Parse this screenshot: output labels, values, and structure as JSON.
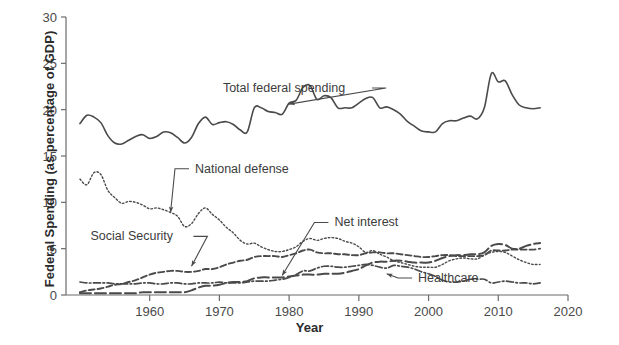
{
  "chart_data": {
    "type": "line",
    "title": "",
    "xlabel": "Year",
    "ylabel": "Federal Spending (as percentage of GDP)",
    "xlim": [
      1948,
      2020
    ],
    "ylim": [
      0,
      30
    ],
    "xticks": [
      1960,
      1970,
      1980,
      1990,
      2000,
      2010,
      2020
    ],
    "xtick_labels": [
      "1960",
      "1970",
      "1980",
      "1990",
      "2000",
      "2010",
      "2020"
    ],
    "yticks": [
      0,
      5,
      10,
      15,
      20,
      25,
      30
    ],
    "ytick_labels": [
      "0",
      "5",
      "10",
      "15",
      "20",
      "25",
      "30"
    ],
    "grid": false,
    "legend_position": "inline-annotations",
    "line_color": "#4a4a4a",
    "series": [
      {
        "name": "Total federal spending",
        "style": "solid",
        "x": [
          1950,
          1951,
          1952,
          1953,
          1954,
          1955,
          1956,
          1957,
          1958,
          1959,
          1960,
          1961,
          1962,
          1963,
          1964,
          1965,
          1966,
          1967,
          1968,
          1969,
          1970,
          1971,
          1972,
          1973,
          1974,
          1975,
          1976,
          1977,
          1978,
          1979,
          1980,
          1981,
          1982,
          1983,
          1984,
          1985,
          1986,
          1987,
          1988,
          1989,
          1990,
          1991,
          1992,
          1993,
          1994,
          1995,
          1996,
          1997,
          1998,
          1999,
          2000,
          2001,
          2002,
          2003,
          2004,
          2005,
          2006,
          2007,
          2008,
          2009,
          2010,
          2011,
          2012,
          2013,
          2014,
          2015,
          2016
        ],
        "values": [
          18.5,
          19.4,
          19.2,
          18.6,
          17.2,
          16.4,
          16.3,
          16.7,
          17.1,
          17.3,
          16.9,
          17.1,
          17.6,
          17.5,
          17.0,
          16.4,
          17.0,
          18.5,
          19.2,
          18.4,
          18.6,
          18.7,
          18.4,
          17.8,
          17.6,
          20.2,
          20.2,
          19.8,
          19.7,
          19.5,
          20.7,
          21.0,
          22.4,
          22.6,
          21.1,
          21.5,
          21.3,
          20.2,
          20.2,
          20.2,
          20.7,
          21.2,
          21.3,
          20.2,
          20.3,
          20.0,
          19.5,
          18.7,
          18.2,
          17.7,
          17.6,
          17.6,
          18.5,
          18.8,
          18.8,
          19.1,
          19.3,
          19.0,
          20.2,
          23.9,
          23.0,
          23.1,
          21.6,
          20.5,
          20.2,
          20.1,
          20.2
        ]
      },
      {
        "name": "National defense",
        "style": "dotted",
        "x": [
          1950,
          1951,
          1952,
          1953,
          1954,
          1955,
          1956,
          1957,
          1958,
          1959,
          1960,
          1961,
          1962,
          1963,
          1964,
          1965,
          1966,
          1967,
          1968,
          1969,
          1970,
          1971,
          1972,
          1973,
          1974,
          1975,
          1976,
          1977,
          1978,
          1979,
          1980,
          1981,
          1982,
          1983,
          1984,
          1985,
          1986,
          1987,
          1988,
          1989,
          1990,
          1991,
          1992,
          1993,
          1994,
          1995,
          1996,
          1997,
          1998,
          1999,
          2000,
          2001,
          2002,
          2003,
          2004,
          2005,
          2006,
          2007,
          2008,
          2009,
          2010,
          2011,
          2012,
          2013,
          2014,
          2015,
          2016
        ],
        "values": [
          12.5,
          11.9,
          13.2,
          13.0,
          11.3,
          10.5,
          9.9,
          10.1,
          10.0,
          9.7,
          9.3,
          9.4,
          9.2,
          8.9,
          8.5,
          7.4,
          7.7,
          8.8,
          9.4,
          8.7,
          8.1,
          7.3,
          6.7,
          5.9,
          5.5,
          5.6,
          5.2,
          4.9,
          4.7,
          4.7,
          4.9,
          5.2,
          5.8,
          6.1,
          5.9,
          6.1,
          6.2,
          6.1,
          5.8,
          5.6,
          5.2,
          4.6,
          4.8,
          4.4,
          4.1,
          3.7,
          3.5,
          3.3,
          3.1,
          3.0,
          3.0,
          3.0,
          3.3,
          3.7,
          3.9,
          4.0,
          3.9,
          3.9,
          4.3,
          4.6,
          4.7,
          4.6,
          4.2,
          3.8,
          3.5,
          3.3,
          3.3
        ]
      },
      {
        "name": "Social Security",
        "style": "dashed",
        "x": [
          1950,
          1951,
          1952,
          1953,
          1954,
          1955,
          1956,
          1957,
          1958,
          1959,
          1960,
          1961,
          1962,
          1963,
          1964,
          1965,
          1966,
          1967,
          1968,
          1969,
          1970,
          1971,
          1972,
          1973,
          1974,
          1975,
          1976,
          1977,
          1978,
          1979,
          1980,
          1981,
          1982,
          1983,
          1984,
          1985,
          1986,
          1987,
          1988,
          1989,
          1990,
          1991,
          1992,
          1993,
          1994,
          1995,
          1996,
          1997,
          1998,
          1999,
          2000,
          2001,
          2002,
          2003,
          2004,
          2005,
          2006,
          2007,
          2008,
          2009,
          2010,
          2011,
          2012,
          2013,
          2014,
          2015,
          2016
        ],
        "values": [
          0.3,
          0.5,
          0.6,
          0.7,
          0.9,
          1.1,
          1.2,
          1.4,
          1.6,
          1.9,
          2.2,
          2.4,
          2.5,
          2.6,
          2.6,
          2.5,
          2.5,
          2.6,
          2.8,
          2.8,
          3.0,
          3.3,
          3.5,
          3.7,
          3.8,
          4.1,
          4.2,
          4.2,
          4.2,
          4.1,
          4.3,
          4.5,
          4.8,
          4.9,
          4.6,
          4.5,
          4.5,
          4.4,
          4.4,
          4.3,
          4.3,
          4.5,
          4.6,
          4.6,
          4.5,
          4.5,
          4.4,
          4.3,
          4.2,
          4.1,
          4.1,
          4.2,
          4.3,
          4.3,
          4.2,
          4.2,
          4.2,
          4.2,
          4.3,
          4.8,
          4.8,
          4.8,
          4.9,
          4.9,
          4.9,
          4.9,
          5.0
        ]
      },
      {
        "name": "Net interest",
        "style": "dash-dot",
        "x": [
          1950,
          1951,
          1952,
          1953,
          1954,
          1955,
          1956,
          1957,
          1958,
          1959,
          1960,
          1961,
          1962,
          1963,
          1964,
          1965,
          1966,
          1967,
          1968,
          1969,
          1970,
          1971,
          1972,
          1973,
          1974,
          1975,
          1976,
          1977,
          1978,
          1979,
          1980,
          1981,
          1982,
          1983,
          1984,
          1985,
          1986,
          1987,
          1988,
          1989,
          1990,
          1991,
          1992,
          1993,
          1994,
          1995,
          1996,
          1997,
          1998,
          1999,
          2000,
          2001,
          2002,
          2003,
          2004,
          2005,
          2006,
          2007,
          2008,
          2009,
          2010,
          2011,
          2012,
          2013,
          2014,
          2015,
          2016
        ],
        "values": [
          1.4,
          1.3,
          1.3,
          1.3,
          1.3,
          1.2,
          1.2,
          1.2,
          1.2,
          1.3,
          1.3,
          1.2,
          1.2,
          1.3,
          1.3,
          1.2,
          1.2,
          1.3,
          1.3,
          1.3,
          1.4,
          1.3,
          1.3,
          1.3,
          1.4,
          1.5,
          1.5,
          1.5,
          1.6,
          1.7,
          1.9,
          2.2,
          2.6,
          2.6,
          2.9,
          3.1,
          3.1,
          3.0,
          3.0,
          3.1,
          3.2,
          3.3,
          3.2,
          3.0,
          2.9,
          3.2,
          3.1,
          3.0,
          2.8,
          2.5,
          2.3,
          2.0,
          1.6,
          1.4,
          1.4,
          1.5,
          1.7,
          1.7,
          1.7,
          1.3,
          1.4,
          1.5,
          1.4,
          1.3,
          1.3,
          1.2,
          1.3
        ]
      },
      {
        "name": "Healthcare",
        "style": "long-dash",
        "x": [
          1950,
          1951,
          1952,
          1953,
          1954,
          1955,
          1956,
          1957,
          1958,
          1959,
          1960,
          1961,
          1962,
          1963,
          1964,
          1965,
          1966,
          1967,
          1968,
          1969,
          1970,
          1971,
          1972,
          1973,
          1974,
          1975,
          1976,
          1977,
          1978,
          1979,
          1980,
          1981,
          1982,
          1983,
          1984,
          1985,
          1986,
          1987,
          1988,
          1989,
          1990,
          1991,
          1992,
          1993,
          1994,
          1995,
          1996,
          1997,
          1998,
          1999,
          2000,
          2001,
          2002,
          2003,
          2004,
          2005,
          2006,
          2007,
          2008,
          2009,
          2010,
          2011,
          2012,
          2013,
          2014,
          2015,
          2016
        ],
        "values": [
          0.2,
          0.2,
          0.2,
          0.2,
          0.2,
          0.2,
          0.2,
          0.2,
          0.2,
          0.3,
          0.3,
          0.3,
          0.3,
          0.3,
          0.3,
          0.3,
          0.5,
          0.8,
          1.0,
          1.0,
          1.1,
          1.3,
          1.4,
          1.4,
          1.5,
          1.8,
          1.9,
          1.9,
          1.9,
          1.9,
          2.0,
          2.1,
          2.2,
          2.2,
          2.2,
          2.3,
          2.3,
          2.3,
          2.4,
          2.6,
          2.8,
          3.2,
          3.5,
          3.6,
          3.6,
          3.7,
          3.7,
          3.6,
          3.5,
          3.5,
          3.5,
          3.7,
          4.0,
          4.2,
          4.3,
          4.3,
          4.4,
          4.4,
          4.6,
          5.3,
          5.5,
          5.4,
          5.0,
          5.0,
          5.3,
          5.5,
          5.6
        ]
      }
    ],
    "annotations": [
      {
        "text": "Total federal spending",
        "label_x": 1970.5,
        "label_y": 21.9,
        "point_x": 1980.0,
        "point_y": 20.6
      },
      {
        "text": "National defense",
        "label_x": 1966.5,
        "label_y": 13.2,
        "point_x": 1963.0,
        "point_y": 8.9
      },
      {
        "text": "Social Security",
        "label_x": 1951.5,
        "label_y": 5.9,
        "point_x": 1966.0,
        "point_y": 3.1
      },
      {
        "text": "Net interest",
        "label_x": 1986.5,
        "label_y": 7.4,
        "point_x": 1979.0,
        "point_y": 2.1
      },
      {
        "text": "Healthcare",
        "label_x": 1998.5,
        "label_y": 1.4,
        "point_x": 1994.0,
        "point_y": 2.3
      }
    ]
  }
}
